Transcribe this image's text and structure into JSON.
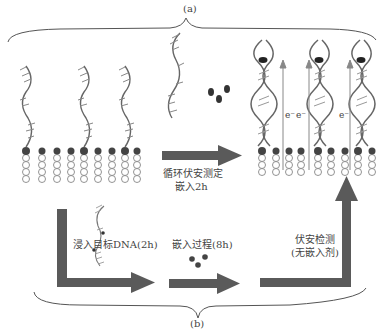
{
  "panel_a": {
    "label": "(a)",
    "step_label_line1": "循环伏安测定",
    "step_label_line2": "嵌入2h",
    "electron_labels": [
      "e⁻",
      "e⁻",
      "e⁻"
    ]
  },
  "panel_b": {
    "label": "(b)",
    "step1_label": "浸入目标DNA(2h)",
    "step2_label": "嵌入过程(8h)",
    "step3_label_line1": "伏安检测",
    "step3_label_line2": "(无嵌入剂)"
  },
  "colors": {
    "arrow": "#5a5a5a",
    "brace": "#555555",
    "dna": "#666666",
    "intercalator": "#333333",
    "electron_arrow": "#888888"
  }
}
